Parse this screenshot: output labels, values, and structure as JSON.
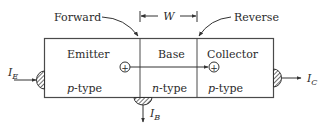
{
  "labels": {
    "forward": "Forward",
    "reverse": "Reverse",
    "width": "W"
  },
  "regions": [
    {
      "name": "Emitter",
      "type": "p",
      "type_suffix": "-type"
    },
    {
      "name": "Base",
      "type": "n",
      "type_suffix": "-type"
    },
    {
      "name": "Collector",
      "type": "p",
      "type_suffix": "-type"
    }
  ],
  "currents": {
    "emitter": {
      "symbol": "I",
      "subscript": "E"
    },
    "base": {
      "symbol": "I",
      "subscript": "B"
    },
    "collector": {
      "symbol": "I",
      "subscript": "C"
    }
  },
  "carrier_symbol": "+",
  "colors": {
    "line": "#4a4a4a",
    "text": "#2b2b2b",
    "background": "#ffffff"
  }
}
